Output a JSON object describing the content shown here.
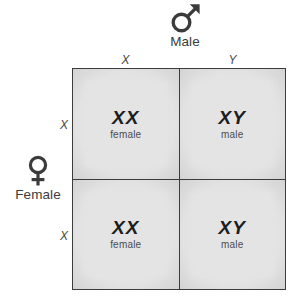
{
  "diagram": {
    "type": "punnett-square",
    "parents": {
      "top": {
        "word": "Male",
        "symbol_name": "mars-symbol",
        "alleles": [
          "X",
          "Y"
        ]
      },
      "left": {
        "word": "Female",
        "symbol_name": "venus-symbol",
        "alleles": [
          "X",
          "X"
        ]
      }
    },
    "column_headers": [
      "X",
      "Y"
    ],
    "row_headers": [
      "X",
      "X"
    ],
    "cells": [
      {
        "genotype": "XX",
        "phenotype": "female"
      },
      {
        "genotype": "XY",
        "phenotype": "male"
      },
      {
        "genotype": "XX",
        "phenotype": "female"
      },
      {
        "genotype": "XY",
        "phenotype": "male"
      }
    ],
    "colors": {
      "background": "#ffffff",
      "grid_line": "#3c3c3c",
      "cell_center": "#e4e4e4",
      "cell_edge": "#9c9c9c",
      "genotype_text": "#1d1d1d",
      "phenotype_text": "#4c4c4c",
      "label_text": "#3b3b3b"
    }
  }
}
